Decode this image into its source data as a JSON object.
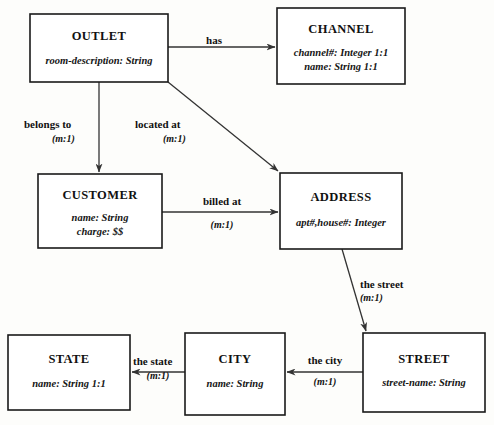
{
  "diagram": {
    "type": "entity-relationship-diagram",
    "background_color": "#fdfdfb",
    "line_color": "#333333",
    "box_border_color": "#1a1a1a",
    "box_fill_color": "#ffffff",
    "text_color": "#111111"
  },
  "entities": [
    {
      "id": "outlet",
      "title": "OUTLET",
      "attributes": [
        "room-description: String"
      ],
      "x": 30,
      "y": 14,
      "w": 138,
      "h": 68
    },
    {
      "id": "channel",
      "title": "CHANNEL",
      "attributes": [
        "channel#: Integer  1:1",
        "name: String  1:1"
      ],
      "x": 277,
      "y": 8,
      "w": 128,
      "h": 76
    },
    {
      "id": "customer",
      "title": "CUSTOMER",
      "attributes": [
        "name: String",
        "charge: $$"
      ],
      "x": 38,
      "y": 174,
      "w": 124,
      "h": 74
    },
    {
      "id": "address",
      "title": "ADDRESS",
      "attributes": [
        "apt#,house#: Integer"
      ],
      "x": 280,
      "y": 173,
      "w": 122,
      "h": 76
    },
    {
      "id": "state",
      "title": "STATE",
      "attributes": [
        "name: String  1:1"
      ],
      "x": 8,
      "y": 335,
      "w": 122,
      "h": 75
    },
    {
      "id": "city",
      "title": "CITY",
      "attributes": [
        "name: String"
      ],
      "x": 185,
      "y": 333,
      "w": 100,
      "h": 82
    },
    {
      "id": "street",
      "title": "STREET",
      "attributes": [
        "street-name: String"
      ],
      "x": 363,
      "y": 333,
      "w": 122,
      "h": 79
    }
  ],
  "relationships": [
    {
      "id": "has",
      "label": "has",
      "cardinality": "",
      "from": "outlet",
      "to": "channel",
      "label_x": 214,
      "label_y": 44,
      "card_x": 0,
      "card_y": 0
    },
    {
      "id": "belongs-to",
      "label": "belongs to",
      "cardinality": "(m:1)",
      "from": "outlet",
      "to": "customer",
      "label_x": 24,
      "label_y": 128,
      "card_x": 52,
      "card_y": 142
    },
    {
      "id": "located-at",
      "label": "located at",
      "cardinality": "(m:1)",
      "from": "outlet",
      "to": "address",
      "label_x": 135,
      "label_y": 128,
      "card_x": 163,
      "card_y": 142
    },
    {
      "id": "billed-at",
      "label": "billed at",
      "cardinality": "(m:1)",
      "from": "customer",
      "to": "address",
      "label_x": 192,
      "label_y": 205,
      "card_x": 205,
      "card_y": 228
    },
    {
      "id": "the-street",
      "label": "the street",
      "cardinality": "(m:1)",
      "from": "address",
      "to": "street",
      "label_x": 360,
      "label_y": 288,
      "card_x": 360,
      "card_y": 301
    },
    {
      "id": "the-city",
      "label": "the city",
      "cardinality": "(m:1)",
      "from": "street",
      "to": "city",
      "label_x": 308,
      "label_y": 364,
      "card_x": 318,
      "card_y": 385
    },
    {
      "id": "the-state",
      "label": "the state",
      "cardinality": "(m:1)",
      "from": "city",
      "to": "state",
      "label_x": 133,
      "label_y": 365,
      "card_x": 148,
      "card_y": 380
    }
  ]
}
